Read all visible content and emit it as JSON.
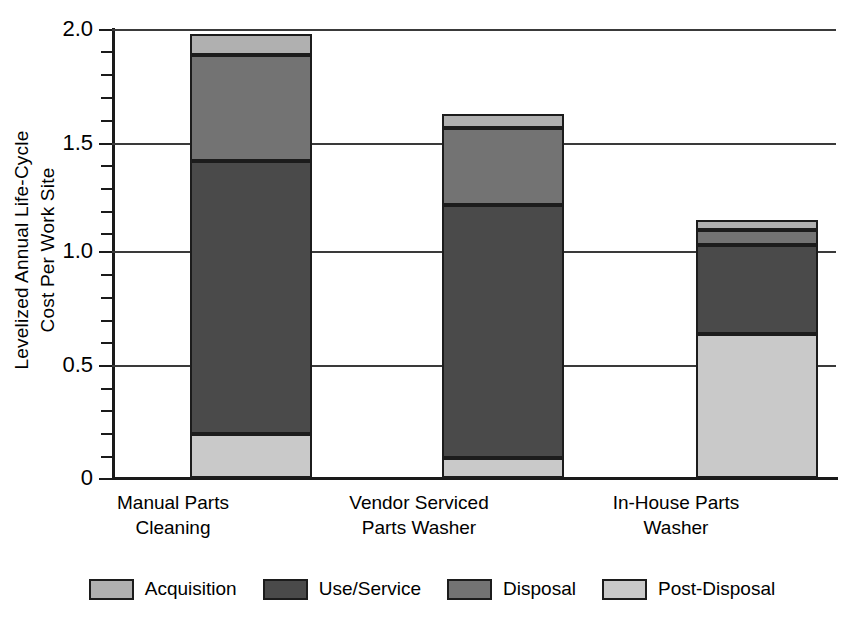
{
  "chart_data": {
    "type": "bar",
    "subtype": "stacked-bar",
    "title": "",
    "xlabel": "",
    "ylabel": "Levelized Annual Life-Cycle Cost Per Work Site",
    "ylabel_lines": [
      "Levelized Annual Life-Cycle",
      "Cost Per Work Site"
    ],
    "categories": [
      "Manual Parts Cleaning",
      "Vendor Serviced Parts Washer",
      "In-House Parts Washer"
    ],
    "category_label_lines": [
      [
        "Manual Parts",
        "Cleaning"
      ],
      [
        "Vendor Serviced",
        "Parts Washer"
      ],
      [
        "In-House Parts",
        "Washer"
      ]
    ],
    "ylim": [
      0,
      2.0
    ],
    "ytick_labels": [
      "0",
      "0.5",
      "1.0",
      "1.5",
      "2.0"
    ],
    "ytick_values": [
      0,
      0.5,
      1.0,
      1.5,
      2.0
    ],
    "yminor_step": 0.1,
    "grid": "horizontal-major",
    "legend_position": "bottom",
    "stack_order_bottom_to_top": [
      "Post-Disposal",
      "Use/Service",
      "Disposal",
      "Acquisition"
    ],
    "series": [
      {
        "name": "Post-Disposal",
        "color": "#c9c9c9",
        "values": [
          0.195,
          0.09,
          0.64
        ]
      },
      {
        "name": "Use/Service",
        "color": "#4a4a4a",
        "values": [
          1.215,
          1.125,
          0.4
        ]
      },
      {
        "name": "Disposal",
        "color": "#737373",
        "values": [
          0.475,
          0.345,
          0.065
        ]
      },
      {
        "name": "Acquisition",
        "color": "#b0b0b0",
        "values": [
          0.095,
          0.06,
          0.045
        ]
      }
    ],
    "totals": [
      1.98,
      1.62,
      1.15
    ]
  },
  "legend": {
    "items": [
      {
        "label": "Acquisition",
        "color": "#b0b0b0"
      },
      {
        "label": "Use/Service",
        "color": "#4a4a4a"
      },
      {
        "label": "Disposal",
        "color": "#737373"
      },
      {
        "label": "Post-Disposal",
        "color": "#c9c9c9"
      }
    ]
  },
  "colors": {
    "acquisition": "#b0b0b0",
    "use_service": "#4a4a4a",
    "disposal": "#737373",
    "post_disposal": "#c9c9c9",
    "axis": "#1a1a1a",
    "grid": "#3a3a3a",
    "background": "#ffffff"
  }
}
